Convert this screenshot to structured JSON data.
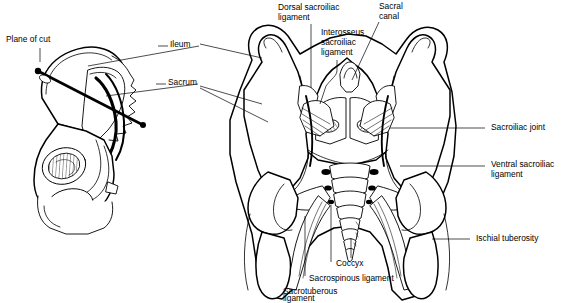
{
  "figure": {
    "background_color": "#ffffff",
    "ink_color": "#000000"
  },
  "labels": {
    "plane_of_cut": "Plane of cut",
    "ileum": "Ileum",
    "sacrum": "Sacrum",
    "dorsal_sacroiliac_ligament_l1": "Dorsal sacroiliac",
    "dorsal_sacroiliac_ligament_l2": "ligament",
    "interosseus_sacroiliac_ligament_l1": "Interosseus",
    "interosseus_sacroiliac_ligament_l2": "sacroiliac",
    "interosseus_sacroiliac_ligament_l3": "ligament",
    "sacral_canal_l1": "Sacral",
    "sacral_canal_l2": "canal",
    "sacroiliac_joint": "Sacroiliac joint",
    "ventral_sacroiliac_ligament_l1": "Ventral sacroiliac",
    "ventral_sacroiliac_ligament_l2": "ligament",
    "ischial_tuberosity": "Ischial tuberosity",
    "coccyx": "Coccyx",
    "sacrospinous_ligament": "Sacrospinous ligament",
    "sacrotuberous_ligament_l1": "Sacrotuberous",
    "sacrotuberous_ligament_l2": "ligament"
  },
  "panels": {
    "left_panel_name": "orientation-pelvis-diagram",
    "right_panel_name": "coronal-section-diagram"
  }
}
